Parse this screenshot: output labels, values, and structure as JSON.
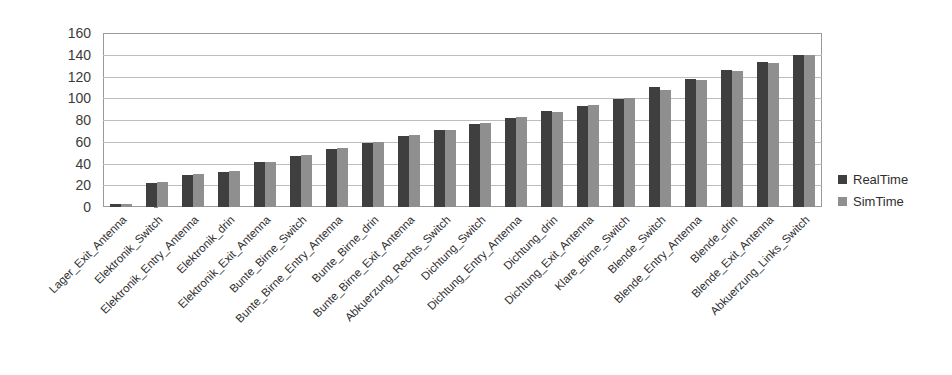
{
  "chart_data": {
    "type": "bar",
    "title": "",
    "xlabel": "",
    "ylabel": "",
    "ylim": [
      0,
      160
    ],
    "yticks": [
      0,
      20,
      40,
      60,
      80,
      100,
      120,
      140,
      160
    ],
    "grid": true,
    "legend_position": "right",
    "categories": [
      "Lager_Exit_Antenna",
      "Elektronik_Switch",
      "Elektronik_Entry_Antenna",
      "Elektronik_drin",
      "Elektronik_Exit_Antenna",
      "Bunte_Birne_Switch",
      "Bunte_Birne_Entry_Antenna",
      "Bunte_Birne_drin",
      "Bunte_Birne_Exit_Antenna",
      "Abkuerzung_Rechts_Switch",
      "Dichtung_Switch",
      "Dichtung_Entry_Antenna",
      "Dichtung_drin",
      "Dichtung_Exit_Antenna",
      "Klare_Birne_Switch",
      "Blende_Switch",
      "Blende_Entry_Antenna",
      "Blende_drin",
      "Blende_Exit_Antenna",
      "Abkuerzung_Links_Switch"
    ],
    "series": [
      {
        "name": "RealTime",
        "color": "#3f3f3f",
        "values": [
          3,
          22,
          29,
          32,
          41,
          47,
          53,
          59,
          65,
          71,
          76,
          82,
          88,
          93,
          99,
          110,
          118,
          126,
          133,
          140
        ]
      },
      {
        "name": "SimTime",
        "color": "#8f8f8f",
        "values": [
          3,
          23,
          30,
          33,
          41,
          48,
          54,
          60,
          66,
          71,
          77,
          83,
          87,
          94,
          100,
          108,
          117,
          125,
          132,
          140
        ]
      }
    ]
  },
  "legend": {
    "items": [
      {
        "label": "RealTime",
        "color": "#3f3f3f"
      },
      {
        "label": "SimTime",
        "color": "#8f8f8f"
      }
    ]
  }
}
